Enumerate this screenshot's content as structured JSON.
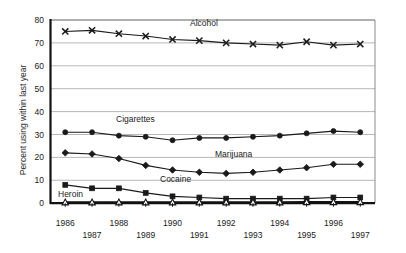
{
  "chart_data": {
    "type": "line",
    "title": "",
    "xlabel": "",
    "ylabel": "Percent using within last year",
    "ylim": [
      0,
      80
    ],
    "yticks": [
      0,
      10,
      20,
      30,
      40,
      50,
      60,
      70,
      80
    ],
    "grid": true,
    "legend": "inline-labels",
    "x": [
      1986,
      1987,
      1988,
      1989,
      1990,
      1991,
      1992,
      1993,
      1994,
      1995,
      1996,
      1997
    ],
    "categories": [
      "1986",
      "1987",
      "1988",
      "1989",
      "1990",
      "1991",
      "1992",
      "1993",
      "1994",
      "1995",
      "1996",
      "1997"
    ],
    "series": [
      {
        "name": "Alcohol",
        "marker": "x",
        "values": [
          75.0,
          75.5,
          74.0,
          73.0,
          71.5,
          71.0,
          70.0,
          69.5,
          69.0,
          70.5,
          69.0,
          69.5
        ]
      },
      {
        "name": "Cigarettes",
        "marker": "circle",
        "values": [
          31.0,
          31.0,
          29.5,
          29.0,
          27.5,
          28.5,
          28.5,
          29.0,
          29.5,
          30.5,
          31.5,
          31.0
        ]
      },
      {
        "name": "Marijuana",
        "marker": "diamond",
        "values": [
          22.0,
          21.5,
          19.5,
          16.5,
          14.5,
          13.5,
          13.0,
          13.5,
          14.5,
          15.5,
          17.0,
          17.0
        ]
      },
      {
        "name": "Cocaine",
        "marker": "square",
        "values": [
          8.0,
          6.5,
          6.5,
          4.5,
          3.0,
          2.5,
          2.0,
          2.0,
          2.0,
          2.0,
          2.5,
          2.5
        ]
      },
      {
        "name": "Heroin",
        "marker": "triangle-hollow",
        "values": [
          0.4,
          0.4,
          0.4,
          0.4,
          0.4,
          0.4,
          0.4,
          0.4,
          0.4,
          0.5,
          0.5,
          0.5
        ]
      }
    ]
  },
  "axis": {
    "y_title": "Percent using within last year",
    "y_ticks": [
      "0",
      "10",
      "20",
      "30",
      "40",
      "50",
      "60",
      "70",
      "80"
    ],
    "x_ticks_top": [
      "1986",
      "1988",
      "1990",
      "1992",
      "1994",
      "1996"
    ],
    "x_ticks_bottom": [
      "1987",
      "1989",
      "1991",
      "1993",
      "1995",
      "1997"
    ]
  },
  "labels": {
    "alcohol": "Alcohol",
    "cigarettes": "Cigarettes",
    "marijuana": "Marijuana",
    "cocaine": "Cocaine",
    "heroin": "Heroin"
  },
  "colors": {
    "ink": "#1a1a1a",
    "grid": "#9a9a9a",
    "frame": "#6e6e6e",
    "background": "#ffffff"
  }
}
